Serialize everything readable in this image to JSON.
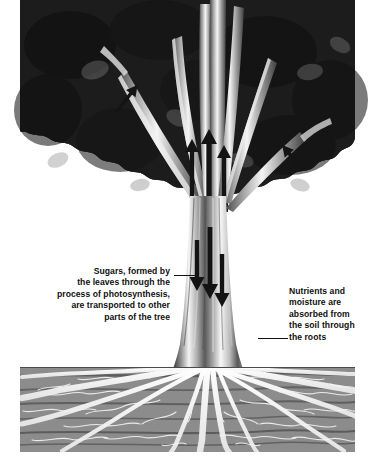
{
  "figure": {
    "background_color": "#ffffff"
  },
  "labels": {
    "sugars": {
      "text": "Sugars, formed by\nthe leaves through the\nprocess of photosynthesis,\nare transported to other\nparts of the tree",
      "align": "right",
      "color": "#101010"
    },
    "nutrients": {
      "text": "Nutrients and\nmoisture are\nabsorbed from\nthe soil through\nthe roots",
      "align": "left",
      "color": "#101010"
    }
  },
  "leaders": {
    "sugars_line": "",
    "nutrients_line": ""
  },
  "scene": {
    "canopy": {
      "name": "tree-canopy",
      "description": "dense dark foliage mass",
      "color_dark": "#151515",
      "color_mid": "#3a3a3a",
      "color_light": "#6b6b6b",
      "bounds": {
        "x": 20,
        "y": 0,
        "width": 335,
        "height": 215
      }
    },
    "trunk": {
      "name": "tree-trunk",
      "color_light": "#f2f2f2",
      "color_mid": "#9a9a9a",
      "color_dark": "#4a4a4a",
      "bounds": {
        "x": 188,
        "y": 0,
        "width": 42,
        "height": 380
      }
    },
    "soil": {
      "name": "soil-block",
      "color_dark": "#3c3c3c",
      "color_mid": "#6e6e6e",
      "color_light": "#a8a8a8",
      "bounds": {
        "x": 20,
        "y": 367,
        "width": 335,
        "height": 85
      }
    },
    "roots": {
      "name": "root-system",
      "color": "#fbfbfb",
      "description": "white branching roots radiating through soil"
    },
    "arrows_down": {
      "name": "phloem-flow-arrows",
      "direction": "down",
      "count": 3,
      "color": "#1a1a1a"
    },
    "arrows_up": {
      "name": "xylem-flow-arrows",
      "direction": "up",
      "count": 3,
      "color": "#1a1a1a"
    }
  }
}
